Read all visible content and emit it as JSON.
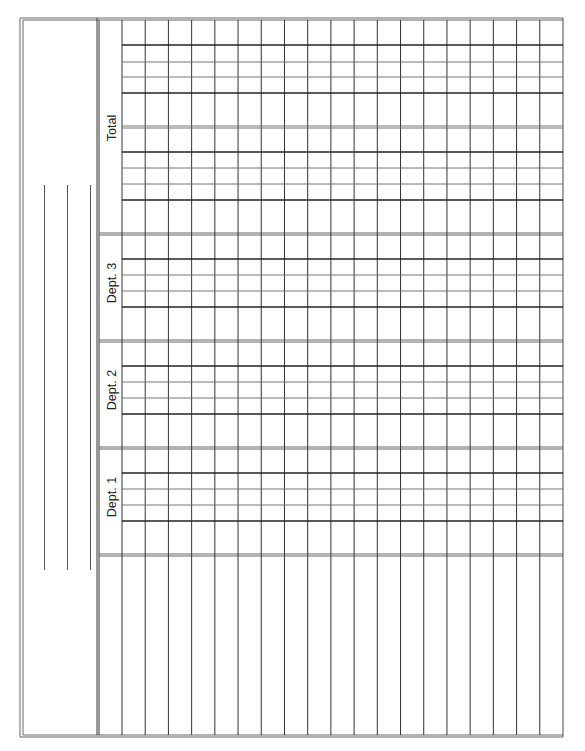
{
  "form": {
    "type": "ledger-worksheet",
    "orientation": "rotated-90",
    "colors": {
      "line": "#333333",
      "thin_line": "#666666",
      "background": "#ffffff",
      "text": "#222222"
    },
    "frame": {
      "left": 20,
      "top": 18,
      "right": 563,
      "bottom": 735
    },
    "header_panel": {
      "right": 97,
      "entry_lines": [
        {
          "x": 44,
          "y1": 185,
          "y2": 570
        },
        {
          "x": 67,
          "y1": 185,
          "y2": 570
        },
        {
          "x": 90,
          "y1": 185,
          "y2": 570
        }
      ]
    },
    "grid": {
      "left": 99,
      "label_column_right": 122,
      "column_count": 19,
      "column_width": 23.21
    },
    "sections": [
      {
        "label": "Total",
        "top": 20,
        "bottom": 234,
        "label_y": 128,
        "rows": [
          {
            "y": 45,
            "weight": "thick"
          },
          {
            "y": 62,
            "weight": "thin"
          },
          {
            "y": 77,
            "weight": "thin"
          },
          {
            "y": 93,
            "weight": "thick"
          },
          {
            "y": 126,
            "weight": "thin"
          },
          {
            "y": 128,
            "weight": "thin"
          },
          {
            "y": 152,
            "weight": "thick"
          },
          {
            "y": 168,
            "weight": "thin"
          },
          {
            "y": 184,
            "weight": "thin"
          },
          {
            "y": 200,
            "weight": "thick"
          }
        ]
      },
      {
        "label": "Dept. 3",
        "top": 235,
        "bottom": 341,
        "label_y": 283,
        "rows": [
          {
            "y": 259,
            "weight": "thick"
          },
          {
            "y": 275,
            "weight": "thin"
          },
          {
            "y": 291,
            "weight": "thin"
          },
          {
            "y": 307,
            "weight": "thick"
          }
        ]
      },
      {
        "label": "Dept. 2",
        "top": 342,
        "bottom": 448,
        "label_y": 390,
        "rows": [
          {
            "y": 366,
            "weight": "thick"
          },
          {
            "y": 382,
            "weight": "thin"
          },
          {
            "y": 398,
            "weight": "thin"
          },
          {
            "y": 414,
            "weight": "thick"
          }
        ]
      },
      {
        "label": "Dept. 1",
        "top": 449,
        "bottom": 555,
        "label_y": 497,
        "rows": [
          {
            "y": 473,
            "weight": "thick"
          },
          {
            "y": 489,
            "weight": "thin"
          },
          {
            "y": 505,
            "weight": "thin"
          },
          {
            "y": 521,
            "weight": "thick"
          }
        ]
      }
    ],
    "section_dividers": [
      233,
      235,
      340,
      342,
      447,
      449,
      554,
      556
    ]
  }
}
